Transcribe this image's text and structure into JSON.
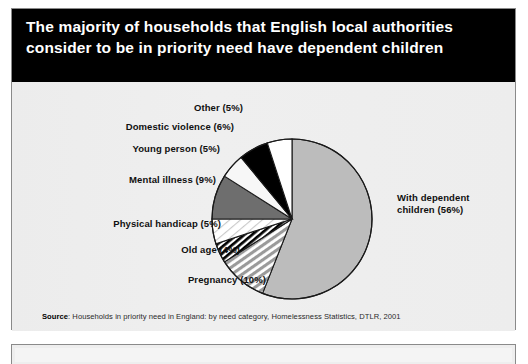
{
  "figure": {
    "title": "The majority of households that English local authorities consider to be in priority need have dependent children",
    "source_prefix": "Source",
    "source_text": ": Households in priority need in England: by need category, Homelessness Statistics, DTLR, 2001"
  },
  "chart_data": {
    "type": "pie",
    "title": "The majority of households that English local authorities consider to be in priority need have dependent children",
    "xlabel": "",
    "ylabel": "",
    "legend_position": "callout-labels",
    "grid": false,
    "units": "percent",
    "categories": [
      "With dependent children",
      "Pregnancy",
      "Old age",
      "Physical handicap",
      "Mental illness",
      "Young person",
      "Domestic violence",
      "Other"
    ],
    "values": [
      56,
      10,
      4,
      5,
      9,
      5,
      6,
      5
    ],
    "labels": [
      "With dependent children (56%)",
      "Pregnancy (10%)",
      "Old age (4%)",
      "Physical handicap (5%)",
      "Mental illness (9%)",
      "Young person (5%)",
      "Domestic violence (6%)",
      "Other (5%)"
    ],
    "fills": [
      "solid-light-grey",
      "diagonal-hatch-grey",
      "diagonal-stripe-black",
      "diagonal-hatch-light",
      "solid-dark-grey",
      "solid-white",
      "solid-black",
      "solid-white"
    ],
    "colors": {
      "with_dependent_children": "#bcbcbc",
      "pregnancy": "#b4b4b4",
      "old_age": "#000000",
      "physical_handicap": "#f2f2f2",
      "mental_illness": "#6e6e6e",
      "young_person": "#f7f7f7",
      "domestic_violence": "#000000",
      "other": "#ffffff",
      "outline": "#1a1a1a",
      "banner": "#000000",
      "panel_background": "#eeeeee"
    },
    "start_angle_deg": 0,
    "direction": "clockwise"
  }
}
